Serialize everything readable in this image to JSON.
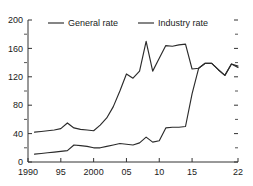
{
  "chart_data": {
    "type": "line",
    "title": "",
    "subtitle": "",
    "xlabel": "",
    "ylabel": "",
    "xlim": [
      1990,
      2022
    ],
    "ylim": [
      0,
      200
    ],
    "grid": false,
    "legend_position": "top",
    "y_ticks": [
      0,
      40,
      80,
      120,
      160,
      200
    ],
    "y_tick_labels": [
      "0",
      "40",
      "80",
      "120",
      "160",
      "200"
    ],
    "y_minor_ticks": [
      20,
      60,
      100,
      140,
      180
    ],
    "x_ticks": [
      1990,
      1995,
      2000,
      2005,
      2010,
      2015,
      2022
    ],
    "x_tick_labels": [
      "1990",
      "95",
      "2000",
      "05",
      "10",
      "15",
      "22"
    ],
    "x": [
      1991,
      1992,
      1993,
      1994,
      1995,
      1996,
      1997,
      1998,
      1999,
      2000,
      2001,
      2002,
      2003,
      2004,
      2005,
      2006,
      2007,
      2008,
      2009,
      2010,
      2011,
      2012,
      2013,
      2014,
      2015,
      2016,
      2017,
      2018,
      2019,
      2020,
      2021,
      2022
    ],
    "series": [
      {
        "name": "General rate",
        "color": "#2b2b2b",
        "values": [
          42,
          43,
          44,
          45,
          47,
          55,
          48,
          46,
          45,
          44,
          52,
          62,
          78,
          100,
          124,
          118,
          128,
          170,
          128,
          146,
          164,
          163,
          165,
          166,
          131,
          132,
          139,
          139,
          130,
          122,
          138,
          133
        ]
      },
      {
        "name": "Industry rate",
        "color": "#2b2b2b",
        "values": [
          11,
          12,
          13,
          14,
          15,
          16,
          24,
          23,
          22,
          20,
          20,
          22,
          24,
          26,
          25,
          24,
          27,
          35,
          28,
          30,
          48,
          49,
          49,
          50,
          96,
          132,
          139,
          139,
          130,
          122,
          138,
          135
        ]
      }
    ]
  }
}
